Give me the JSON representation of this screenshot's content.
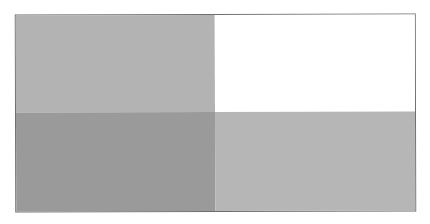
{
  "figure": {
    "type": "2x2-grid",
    "border_color": "#6e6e6e",
    "quadrants": [
      {
        "position": "top-left",
        "color": "#b3b3b3",
        "shade": "light-gray"
      },
      {
        "position": "top-right",
        "color": "#ffffff",
        "shade": "white"
      },
      {
        "position": "bottom-left",
        "color": "#9a9a9a",
        "shade": "dark-gray"
      },
      {
        "position": "bottom-right",
        "color": "#b6b6b6",
        "shade": "light-gray"
      }
    ]
  }
}
